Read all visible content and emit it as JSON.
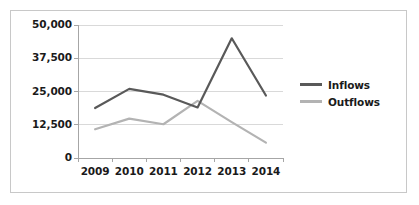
{
  "chart_data": {
    "type": "line",
    "title": "",
    "xlabel": "",
    "ylabel": "",
    "categories": [
      "2009",
      "2010",
      "2011",
      "2012",
      "2013",
      "2014"
    ],
    "series": [
      {
        "name": "Inflows",
        "color": "#595959",
        "values": [
          18800,
          26000,
          23800,
          19000,
          45000,
          23500
        ]
      },
      {
        "name": "Outflows",
        "color": "#b3b3b3",
        "values": [
          10800,
          14800,
          12700,
          21500,
          13500,
          5800
        ]
      }
    ],
    "ylim": [
      0,
      50000
    ],
    "yticks": [
      0,
      12500,
      25000,
      37500,
      50000
    ],
    "ytick_labels": [
      "0",
      "12,500",
      "25,000",
      "37,500",
      "50,000"
    ],
    "grid": true,
    "grid_axis": "y",
    "legend_position": "right",
    "axis_color": "#a6a6a6",
    "grid_color": "#d9d9d9",
    "background": "#ffffff",
    "border_color": "#c8c8c8"
  },
  "legend": {
    "items": [
      {
        "label": "Inflows",
        "color": "#595959"
      },
      {
        "label": "Outflows",
        "color": "#b3b3b3"
      }
    ]
  }
}
